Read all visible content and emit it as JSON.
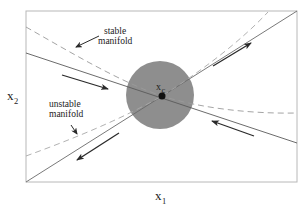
{
  "diagram": {
    "type": "phase-portrait",
    "colors": {
      "frame": "#b8b8b8",
      "line": "#666666",
      "dashed": "#9a9a9a",
      "disk": "#8e8e8e",
      "arrow": "#2a2a2a",
      "point": "#111111",
      "text": "#222222"
    },
    "frame": {
      "x": 26,
      "y": 11,
      "width": 271,
      "height": 171
    },
    "fixed_point": {
      "label": "x",
      "subscript": "c",
      "cx": 162,
      "cy": 96,
      "r": 3.5
    },
    "neighborhood": {
      "cx": 160,
      "cy": 95,
      "r": 34
    },
    "labels": {
      "stable_line1": "stable",
      "stable_line2": "manifold",
      "unstable_line1": "unstable",
      "unstable_line2": "manifold"
    },
    "axes": {
      "x_label": "x",
      "x_sub": "1",
      "y_label": "x",
      "y_sub": "2"
    }
  }
}
